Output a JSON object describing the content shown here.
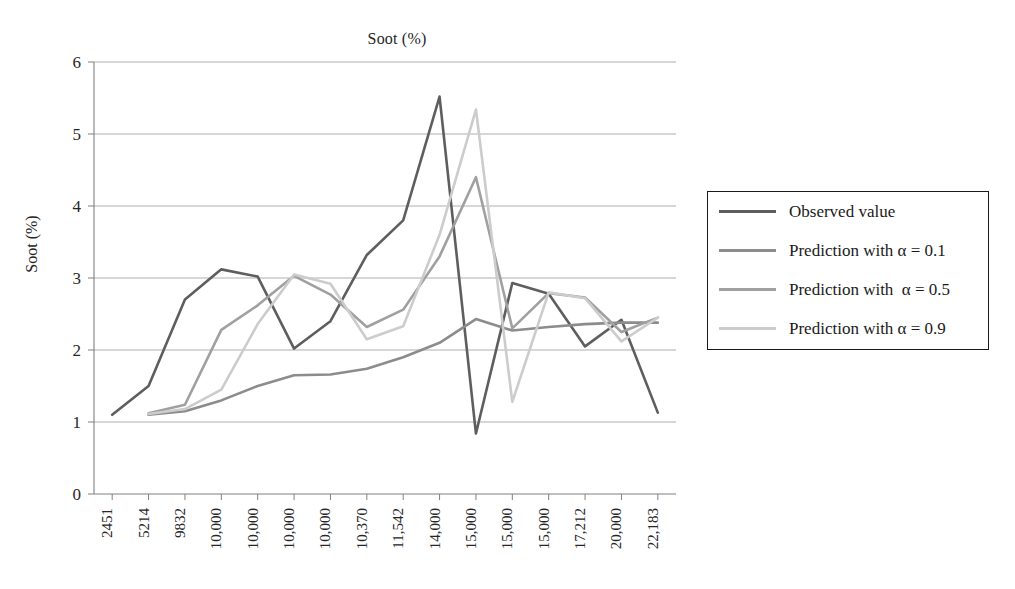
{
  "chart_data": {
    "type": "line",
    "title": "Soot (%)",
    "xlabel": "",
    "ylabel": "Soot (%)",
    "ylim": [
      0,
      6
    ],
    "yticks": [
      0,
      1,
      2,
      3,
      4,
      5,
      6
    ],
    "grid": "horizontal",
    "legend_position": "right",
    "categories": [
      "2451",
      "5214",
      "9832",
      "10,000",
      "10,000",
      "10,000",
      "10,000",
      "10,370",
      "11,542",
      "14,000",
      "15,000",
      "15,000",
      "15,000",
      "17,212",
      "20,000",
      "22,183"
    ],
    "series": [
      {
        "name": "Observed value",
        "color": "#5e5e5e",
        "values": [
          1.1,
          1.5,
          2.7,
          3.12,
          3.02,
          2.02,
          2.4,
          3.32,
          3.8,
          5.52,
          0.84,
          2.93,
          2.78,
          2.05,
          2.42,
          1.13
        ]
      },
      {
        "name": "Prediction with α = 0.1",
        "color": "#8c8c8c",
        "values": [
          null,
          1.1,
          1.15,
          1.3,
          1.5,
          1.65,
          1.66,
          1.74,
          1.9,
          2.1,
          2.43,
          2.27,
          2.32,
          2.36,
          2.38,
          2.38
        ]
      },
      {
        "name": "Prediction with  α = 0.5",
        "color": "#a0a0a0",
        "values": [
          null,
          1.12,
          1.24,
          2.28,
          2.62,
          3.03,
          2.77,
          2.32,
          2.56,
          3.3,
          4.4,
          2.3,
          2.79,
          2.73,
          2.25,
          2.45
        ]
      },
      {
        "name": "Prediction with α = 0.9",
        "color": "#cccccc",
        "values": [
          null,
          1.11,
          1.18,
          1.45,
          2.36,
          3.05,
          2.92,
          2.15,
          2.33,
          3.6,
          5.34,
          1.28,
          2.8,
          2.72,
          2.12,
          2.45
        ]
      }
    ]
  },
  "legend": {
    "items": [
      {
        "label": "Observed value"
      },
      {
        "label": "Prediction with α = 0.1"
      },
      {
        "label": "Prediction with  α = 0.5"
      },
      {
        "label": "Prediction with α = 0.9"
      }
    ]
  }
}
